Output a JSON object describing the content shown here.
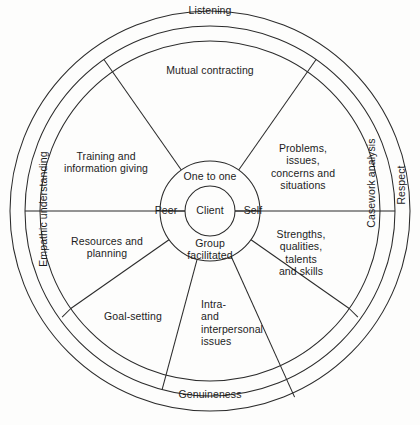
{
  "diagram": {
    "geometry": {
      "center_x": 210,
      "center_y": 211,
      "r_outer": 200,
      "r_ring2": 185,
      "r_wheel": 170,
      "r_inner_annulus": 50,
      "r_core": 25
    },
    "stroke_color": "#2b2b2b",
    "background_color": "#fdfdfc",
    "outer_ring": {
      "name": "core-conditions-ring",
      "labels": [
        {
          "id": "listening",
          "text": "Listening",
          "position": "top"
        },
        {
          "id": "respect",
          "text": "Respect",
          "position": "right"
        },
        {
          "id": "genuineness",
          "text": "Genuineness",
          "position": "bottom"
        },
        {
          "id": "empathic-understanding",
          "text": "Empathic understanding",
          "position": "left"
        }
      ]
    },
    "middle_ring": {
      "name": "process-ring",
      "labels": [
        {
          "id": "mutual-contracting",
          "text": "Mutual contracting",
          "position": "top"
        },
        {
          "id": "casework-analysis",
          "text": "Casework analysis",
          "position": "right"
        }
      ]
    },
    "wheel_sectors": {
      "name": "activity-sectors",
      "labels": [
        {
          "id": "training-and-information-giving",
          "text": "Training and\ninformation giving",
          "position": "upper-left"
        },
        {
          "id": "resources-and-planning",
          "text": "Resources and\nplanning",
          "position": "lower-left"
        },
        {
          "id": "problems-issues-concerns-and-situations",
          "text": "Problems,\nissues,\nconcerns and\nsituations",
          "position": "upper-right"
        },
        {
          "id": "strengths-qualities-talents-and-skills",
          "text": "Strengths,\nqualities,\ntalents\nand skills",
          "position": "lower-right"
        },
        {
          "id": "goal-setting",
          "text": "Goal-setting",
          "position": "bottom-left"
        },
        {
          "id": "intra-and-interpersonal-issues",
          "text": "Intra-\nand\ninterpersonal\nissues",
          "position": "bottom-center"
        }
      ]
    },
    "inner_annulus": {
      "name": "modality-annulus",
      "labels": [
        {
          "id": "one-to-one",
          "text": "One to one",
          "position": "top"
        },
        {
          "id": "peer",
          "text": "Peer",
          "position": "left"
        },
        {
          "id": "self",
          "text": "Self",
          "position": "right"
        },
        {
          "id": "group-facilitated",
          "text": "Group\nfacilitated",
          "position": "bottom"
        }
      ]
    },
    "core": {
      "name": "client-core",
      "label": {
        "id": "client",
        "text": "Client"
      }
    }
  }
}
